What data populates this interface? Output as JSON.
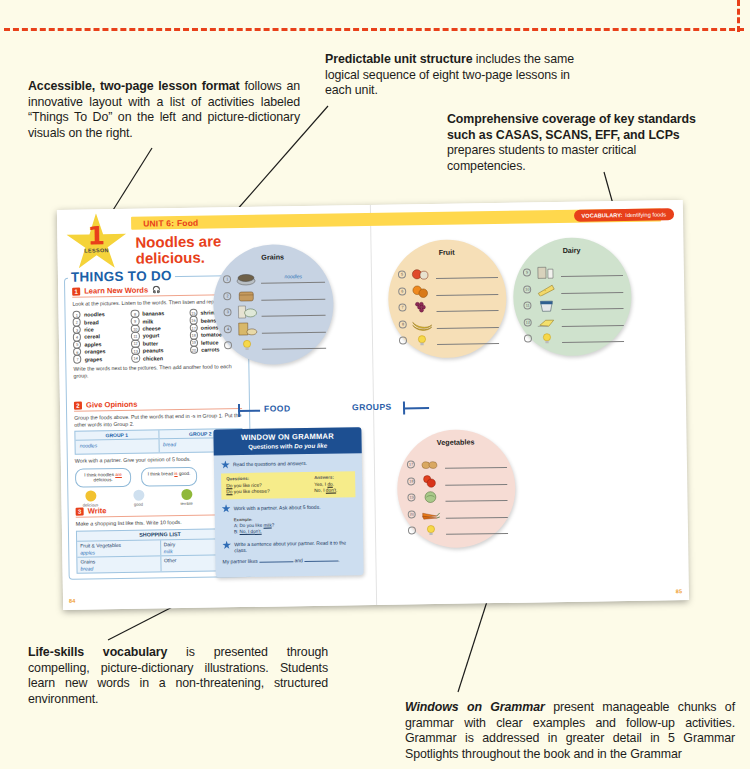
{
  "callouts": {
    "accessible_format": {
      "bold": "Accessible, two-page lesson format",
      "rest": " follows an innovative layout with a list of activities labeled “Things To Do” on the left and picture-dictionary visuals on the right."
    },
    "predictable_structure": {
      "bold": "Predictable unit structure",
      "rest": " includes the same logical sequence of eight two-page lessons in each unit."
    },
    "comprehensive_coverage": {
      "bold": "Comprehensive coverage of key standards such as CASAS, SCANS, EFF, and LCPs",
      "rest": " prepares students to master critical competencies."
    },
    "life_skills": {
      "bold": "Life-skills vocabulary",
      "rest": " is presented through compelling, picture-dictionary illustrations. Students learn new words in a non-threatening, structured environment."
    },
    "windows_on_grammar": {
      "bold": "Windows on Grammar",
      "rest": " present manageable chunks of grammar with clear examples and follow-up activities. Grammar is addressed in greater detail in 5 Grammar Spotlights throughout the book and in the Grammar"
    }
  },
  "spread": {
    "unit_label": "UNIT 6: Food",
    "vocabulary_badge": {
      "label": "VOCABULARY:",
      "text": "Identifying foods"
    },
    "lesson_star": {
      "number": "1",
      "label": "LESSON"
    },
    "headline": "Noodles are delicious.",
    "page_left": "84",
    "page_right": "85",
    "things_to_do": {
      "title": "THINGS TO DO",
      "activities": [
        {
          "num": "1",
          "name": "Learn New Words",
          "instruction": "Look at the pictures. Listen to the words. Then listen and repeat.",
          "followup": "Write the words next to the pictures. Then add another food to each group.",
          "words": [
            {
              "n": "1",
              "w": "noodles"
            },
            {
              "n": "2",
              "w": "bread"
            },
            {
              "n": "3",
              "w": "rice"
            },
            {
              "n": "4",
              "w": "cereal"
            },
            {
              "n": "5",
              "w": "apples"
            },
            {
              "n": "6",
              "w": "oranges"
            },
            {
              "n": "7",
              "w": "grapes"
            },
            {
              "n": "8",
              "w": "bananas"
            },
            {
              "n": "9",
              "w": "milk"
            },
            {
              "n": "10",
              "w": "cheese"
            },
            {
              "n": "11",
              "w": "yogurt"
            },
            {
              "n": "12",
              "w": "butter"
            },
            {
              "n": "13",
              "w": "peanuts"
            },
            {
              "n": "14",
              "w": "chicken"
            },
            {
              "n": "15",
              "w": "shrimp"
            },
            {
              "n": "16",
              "w": "beans"
            },
            {
              "n": "17",
              "w": "onions"
            },
            {
              "n": "18",
              "w": "tomatoes"
            },
            {
              "n": "19",
              "w": "lettuce"
            },
            {
              "n": "20",
              "w": "carrots"
            }
          ]
        },
        {
          "num": "2",
          "name": "Give Opinions",
          "instruction": "Group the foods above. Put the words that end in -s in Group 1. Put the other words into Group 2.",
          "followup": "Work with a partner. Give your opinion of 5 foods.",
          "group_table": {
            "headers": [
              "GROUP 1",
              "GROUP 2"
            ],
            "values": [
              "noodles",
              "bread"
            ]
          },
          "bubbles": [
            {
              "pre": "I think noodles ",
              "em": "are",
              "post": " delicious."
            },
            {
              "pre": "I think bread ",
              "em": "is",
              "post": " good."
            }
          ],
          "faces": [
            {
              "label": "delicious",
              "color": "#f2c230"
            },
            {
              "label": "good",
              "color": "#cfe0ef"
            },
            {
              "label": "terrible",
              "color": "#8fb83a"
            }
          ]
        },
        {
          "num": "3",
          "name": "Write",
          "instruction": "Make a shopping list like this. Write 10 foods.",
          "shopping_list": {
            "title": "SHOPPING LIST",
            "rows": [
              [
                {
                  "head": "Fruit & Vegetables",
                  "item": "apples"
                },
                {
                  "head": "Dairy",
                  "item": "milk"
                }
              ],
              [
                {
                  "head": "Grains",
                  "item": "bread"
                },
                {
                  "head": "Other",
                  "item": ""
                }
              ]
            ]
          }
        }
      ]
    },
    "banner": {
      "left": "FOOD",
      "right": "GROUPS"
    },
    "circles": [
      {
        "name": "Grains",
        "color": "#c7d3e3",
        "line": "#6a7a8c",
        "items": [
          {
            "n": "1",
            "thumb": "noodles",
            "written": "noodles"
          },
          {
            "n": "2",
            "thumb": "bread",
            "written": ""
          },
          {
            "n": "3",
            "thumb": "rice",
            "written": ""
          },
          {
            "n": "4",
            "thumb": "cereal",
            "written": ""
          },
          {
            "n": "",
            "thumb": "bulb",
            "written": ""
          }
        ]
      },
      {
        "name": "Fruit",
        "color": "#f6dfb7",
        "line": "#8a7448",
        "items": [
          {
            "n": "5",
            "thumb": "apples",
            "written": ""
          },
          {
            "n": "6",
            "thumb": "oranges",
            "written": ""
          },
          {
            "n": "7",
            "thumb": "grapes",
            "written": ""
          },
          {
            "n": "8",
            "thumb": "bananas",
            "written": ""
          },
          {
            "n": "",
            "thumb": "bulb",
            "written": ""
          }
        ]
      },
      {
        "name": "Dairy",
        "color": "#cfe2cd",
        "line": "#5d7a58",
        "items": [
          {
            "n": "9",
            "thumb": "milk",
            "written": ""
          },
          {
            "n": "10",
            "thumb": "cheese",
            "written": ""
          },
          {
            "n": "11",
            "thumb": "yogurt",
            "written": ""
          },
          {
            "n": "12",
            "thumb": "butter",
            "written": ""
          },
          {
            "n": "",
            "thumb": "bulb",
            "written": ""
          }
        ]
      },
      {
        "name": "Meat, Fish, Beans, Nuts",
        "color": "#f8ecae",
        "line": "#8a7f3f",
        "items": [
          {
            "n": "13",
            "thumb": "peanuts",
            "written": ""
          },
          {
            "n": "14",
            "thumb": "chicken",
            "written": ""
          },
          {
            "n": "15",
            "thumb": "shrimp",
            "written": ""
          },
          {
            "n": "16",
            "thumb": "beans",
            "written": ""
          },
          {
            "n": "",
            "thumb": "bulb",
            "written": ""
          }
        ]
      },
      {
        "name": "Vegetables",
        "color": "#f6dcd4",
        "line": "#8a655c",
        "items": [
          {
            "n": "17",
            "thumb": "onions",
            "written": ""
          },
          {
            "n": "18",
            "thumb": "tomatoes",
            "written": ""
          },
          {
            "n": "19",
            "thumb": "lettuce",
            "written": ""
          },
          {
            "n": "20",
            "thumb": "carrots",
            "written": ""
          },
          {
            "n": "",
            "thumb": "bulb",
            "written": ""
          }
        ]
      }
    ],
    "window_on_grammar": {
      "title": "WINDOW ON GRAMMAR",
      "subtitle_pre": "Questions with ",
      "subtitle_em": "Do you like",
      "steps": [
        {
          "text": "Read the questions and answers."
        },
        {
          "text": "Work with a partner. Ask about 5 foods."
        },
        {
          "text": "Write a sentence about your partner. Read it to the class."
        }
      ],
      "qa": {
        "col1_head": "Questions:",
        "col2_head": "Answers:",
        "rows": [
          {
            "q_em": "Do",
            "q_rest": " you like rice?",
            "a_pre": "Yes, I ",
            "a_em": "do",
            "a_post": "."
          },
          {
            "q_em": "Do",
            "q_rest": " you like cheese?",
            "a_pre": "No, I ",
            "a_em": "don't",
            "a_post": "."
          }
        ]
      },
      "example": {
        "label": "Example:",
        "line_a_pre": "A: Do you like ",
        "line_a_em": "milk",
        "line_a_post": "?",
        "line_b_pre": "B: ",
        "line_b_em": "No, I don't."
      },
      "partner_line_pre": "My partner likes ",
      "partner_line_mid": " and ",
      "partner_line_post": "."
    }
  }
}
